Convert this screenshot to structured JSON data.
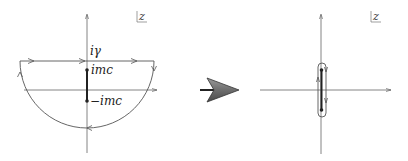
{
  "left_panel": {
    "plane_label": "z",
    "labels": {
      "top": "iγ",
      "upper_branch": "imc",
      "lower_branch": "−imc"
    },
    "contour": "closed semicircular contour in lower half-plane, top segment at iγ, traversed with arrows"
  },
  "transform_arrow": {
    "direction": "right",
    "color": "#6e6e6e"
  },
  "right_panel": {
    "plane_label": "z",
    "contour": "contour collapsed around branch cut from -imc to imc"
  },
  "colors": {
    "line": "#555555",
    "cut": "#222222",
    "background": "#ffffff"
  }
}
